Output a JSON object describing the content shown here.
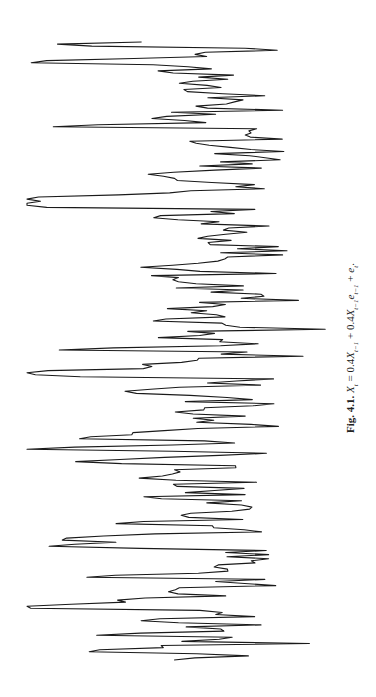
{
  "figure": {
    "label": "Fig. 4.1.",
    "equation_parts": {
      "lhs": "X",
      "lhs_sub": "t",
      "eq": " = 0.4",
      "x1": "X",
      "x1_sub": "t−1",
      "plus1": " + 0.4",
      "x2": "X",
      "x2_sub": "t−1",
      "e1": "e",
      "e1_sub": "t−1",
      "plus2": " + ",
      "e2": "e",
      "e2_sub": "t",
      "end": "."
    },
    "caption_full": "Fig. 4.1. X_t = 0.4X_{t−1} + 0.4X_{t−1}e_{t−1} + e_t."
  },
  "chart_data": {
    "type": "line",
    "orientation": "rotated 90° counter-clockwise (time runs top to bottom, values horizontal)",
    "xlabel": "",
    "ylabel": "",
    "axes_visible": false,
    "grid": false,
    "legend": null,
    "n_points": 300,
    "value_range_approx": [
      -3.0,
      5.5
    ],
    "series": [
      {
        "name": "X_t",
        "color": "#1a1a1a",
        "seed": 41,
        "values_generator": "bilinear: X_t = 0.4X_{t-1} + 0.4X_{t-1}e_{t-1} + e_t, e_t ~ N(0,1)"
      }
    ],
    "render": {
      "time_top_px": 42,
      "time_bottom_px": 660,
      "zero_x_px": 225,
      "px_per_unit": 36
    }
  }
}
